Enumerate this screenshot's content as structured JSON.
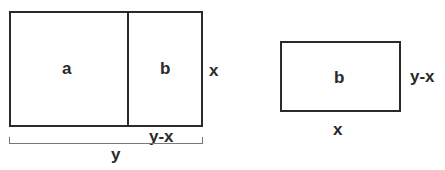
{
  "left_figure": {
    "regions": [
      {
        "label": "a"
      },
      {
        "label": "b"
      }
    ],
    "side_label": "x",
    "bottom_segment_label": "y-x",
    "total_width_label": "y"
  },
  "right_figure": {
    "region_label": "b",
    "side_label": "y-x",
    "bottom_label": "x"
  }
}
